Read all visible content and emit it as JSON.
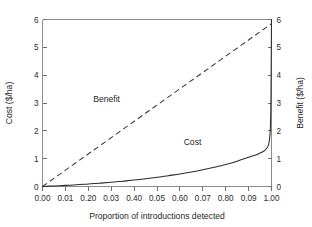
{
  "chart_data": {
    "type": "line",
    "title": "",
    "xlabel": "Proportion of introductions detected",
    "ylabel": "Cost ($/ha)",
    "y2label": "Benefit ($/ha)",
    "xlim": [
      0.0,
      1.0
    ],
    "ylim": [
      0,
      6
    ],
    "y2lim": [
      0,
      6
    ],
    "grid": false,
    "legend": "inline-curve-labels",
    "xticks": [
      0.0,
      0.1,
      0.2,
      0.3,
      0.4,
      0.5,
      0.6,
      0.7,
      0.8,
      0.9,
      1.0
    ],
    "xticklabels": [
      "0.00",
      "0.01",
      "0.20",
      "0.03",
      "0.40",
      "0.05",
      "0.60",
      "0.07",
      "0.80",
      "0.09",
      "1.00"
    ],
    "yticks": [
      0,
      1,
      2,
      3,
      4,
      5,
      6
    ],
    "yticklabels": [
      "0",
      "1",
      "2",
      "3",
      "4",
      "5",
      "6"
    ],
    "y2ticks": [
      0,
      1,
      2,
      3,
      4,
      5,
      6
    ],
    "y2ticklabels": [
      "0",
      "1",
      "2",
      "3",
      "4",
      "5",
      "6"
    ],
    "series": [
      {
        "name": "Benefit",
        "axis": "right",
        "style": "dashed",
        "label_text": "Benefit",
        "label_x": 0.28,
        "label_y": 3.05,
        "x": [
          0.0,
          0.1,
          0.2,
          0.3,
          0.4,
          0.5,
          0.6,
          0.7,
          0.8,
          0.9,
          1.0
        ],
        "values": [
          0.0,
          0.585,
          1.17,
          1.755,
          2.34,
          2.925,
          3.51,
          4.095,
          4.68,
          5.265,
          5.85
        ]
      },
      {
        "name": "Cost",
        "axis": "left",
        "style": "solid",
        "label_text": "Cost",
        "label_x": 0.655,
        "label_y": 1.48,
        "x": [
          0.0,
          0.05,
          0.1,
          0.15,
          0.2,
          0.25,
          0.3,
          0.35,
          0.4,
          0.45,
          0.5,
          0.55,
          0.6,
          0.65,
          0.7,
          0.75,
          0.8,
          0.85,
          0.9,
          0.93,
          0.95,
          0.96,
          0.97,
          0.975,
          0.98,
          0.985,
          0.988,
          0.99,
          0.992,
          0.994,
          0.995,
          0.996,
          0.997,
          0.998,
          0.999,
          1.0
        ],
        "values": [
          0.0,
          0.02,
          0.04,
          0.06,
          0.09,
          0.12,
          0.15,
          0.19,
          0.23,
          0.28,
          0.33,
          0.39,
          0.45,
          0.52,
          0.6,
          0.69,
          0.79,
          0.91,
          1.05,
          1.13,
          1.2,
          1.24,
          1.29,
          1.33,
          1.38,
          1.46,
          1.53,
          1.62,
          1.75,
          1.95,
          2.1,
          2.35,
          2.75,
          3.5,
          4.8,
          6.0
        ]
      }
    ]
  },
  "axes": {
    "x_title": "Proportion of introductions detected",
    "y_left_title": "Cost ($/ha)",
    "y_right_title": "Benefit ($/ha)"
  },
  "annotations": {
    "benefit_label": "Benefit",
    "cost_label": "Cost"
  },
  "colors": {
    "background": "#ffffff",
    "frame": "#8c8c8c",
    "cost_line": "#2b2b2b",
    "benefit_line": "#3a3a3a",
    "text": "#1f1f1f"
  }
}
